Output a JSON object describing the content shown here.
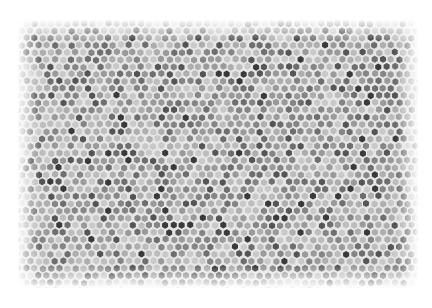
{
  "image": {
    "description": "Grayscale hexagonal cell mosaic texture with soft white vignette border",
    "width": 432,
    "height": 308,
    "background": "#ffffff",
    "mosaic": {
      "region": {
        "x": 18,
        "y": 20,
        "width": 400,
        "height": 268
      },
      "cell_width": 8.2,
      "cell_row_height": 7.2,
      "gap_color": "#e6e6e6",
      "tones": [
        "#3a3a3a",
        "#555555",
        "#6e6e6e",
        "#858585",
        "#9a9a9a",
        "#aeaeae",
        "#bdbdbd",
        "#c9c9c9"
      ],
      "tone_weights": [
        0.05,
        0.08,
        0.12,
        0.15,
        0.18,
        0.18,
        0.14,
        0.1
      ],
      "seed": 1729,
      "edge_feather": 22
    }
  }
}
